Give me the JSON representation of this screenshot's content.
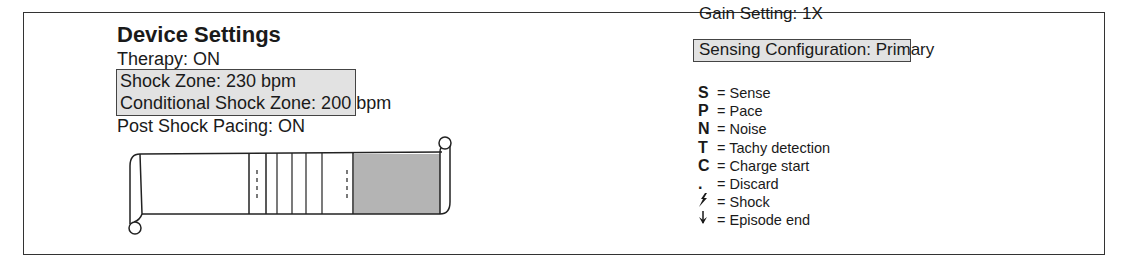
{
  "device_settings": {
    "title": "Device Settings",
    "therapy": "Therapy: ON",
    "shock_zone": "Shock Zone: 230 bpm",
    "conditional_shock_zone": "Conditional Shock Zone: 200 bpm",
    "post_shock_pacing": "Post Shock Pacing: ON"
  },
  "sensing": {
    "gain_setting": "Gain Setting: 1X",
    "sensing_configuration": "Sensing Configuration: Primary"
  },
  "legend": [
    {
      "key": "S",
      "label": "= Sense",
      "icon": "letter"
    },
    {
      "key": "P",
      "label": "= Pace",
      "icon": "letter"
    },
    {
      "key": "N",
      "label": "= Noise",
      "icon": "letter"
    },
    {
      "key": "T",
      "label": "= Tachy detection",
      "icon": "letter"
    },
    {
      "key": "C",
      "label": "= Charge start",
      "icon": "letter"
    },
    {
      "key": ".",
      "label": "= Discard",
      "icon": "dot"
    },
    {
      "key": "",
      "label": "= Shock",
      "icon": "lightning-bolt-icon"
    },
    {
      "key": "",
      "label": "= Episode end",
      "icon": "down-arrow-icon"
    }
  ],
  "colors": {
    "highlight_fill": "#e2e2e2",
    "scroll_shaded": "#b4b4b4",
    "line": "#333333"
  }
}
